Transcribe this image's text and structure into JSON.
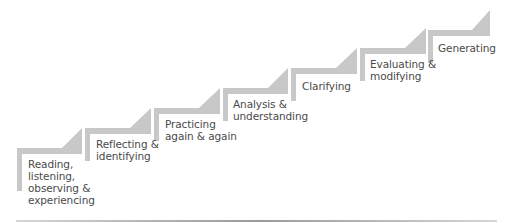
{
  "diagram": {
    "type": "staircase",
    "colors": {
      "step": "#c8c8c8",
      "text": "#4a4a4a",
      "background": "#ffffff"
    },
    "steps": [
      {
        "label": "Reading,\nlistening,\nobserving &\nexperiencing"
      },
      {
        "label": "Reflecting &\nidentifying"
      },
      {
        "label": "Practicing\nagain & again"
      },
      {
        "label": "Analysis &\nunderstanding"
      },
      {
        "label": "Clarifying"
      },
      {
        "label": "Evaluating &\nmodifying"
      },
      {
        "label": "Generating"
      }
    ]
  }
}
